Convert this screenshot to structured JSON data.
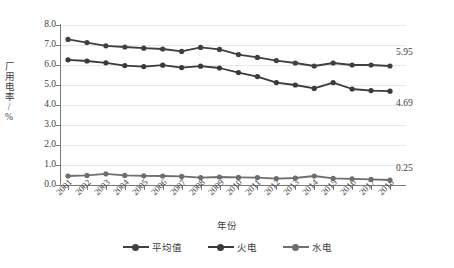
{
  "chart_data": {
    "type": "line",
    "title": "",
    "xlabel": "年份",
    "ylabel": "厂用电率/%",
    "ylim": [
      0.0,
      8.0
    ],
    "ytick_step": 1.0,
    "grid": true,
    "legend_position": "bottom",
    "categories": [
      "2001",
      "2002",
      "2003",
      "2004",
      "2005",
      "2006",
      "2007",
      "2008",
      "2009",
      "2010",
      "2011",
      "2012",
      "2013",
      "2014",
      "2015",
      "2016",
      "2017",
      "2018"
    ],
    "yticks": [
      "0.0",
      "1.0",
      "2.0",
      "3.0",
      "4.0",
      "5.0",
      "6.0",
      "7.0",
      "8.0"
    ],
    "series": [
      {
        "name": "平均值",
        "color": "#404040",
        "values": [
          7.28,
          7.12,
          6.96,
          6.9,
          6.84,
          6.8,
          6.68,
          6.88,
          6.78,
          6.52,
          6.38,
          6.22,
          6.1,
          5.95,
          6.1,
          6.0,
          6.0,
          5.95
        ],
        "end_label": "5.95"
      },
      {
        "name": "火电",
        "color": "#3a3a3a",
        "values": [
          6.26,
          6.2,
          6.11,
          5.97,
          5.92,
          5.99,
          5.87,
          5.94,
          5.85,
          5.62,
          5.42,
          5.12,
          5.0,
          4.83,
          5.12,
          4.8,
          4.72,
          4.69
        ],
        "end_label": "4.69"
      },
      {
        "name": "水电",
        "color": "#6e6e6e",
        "values": [
          0.45,
          0.48,
          0.56,
          0.48,
          0.46,
          0.45,
          0.43,
          0.37,
          0.4,
          0.38,
          0.37,
          0.32,
          0.35,
          0.45,
          0.33,
          0.31,
          0.28,
          0.25
        ],
        "end_label": "0.25"
      }
    ]
  }
}
